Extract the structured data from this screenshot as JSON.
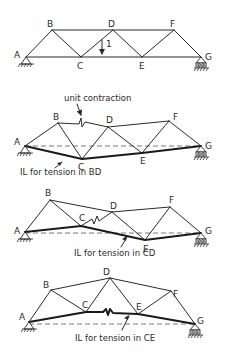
{
  "diagram": {
    "truss_original": {
      "labels": {
        "A": "A",
        "B": "B",
        "C": "C",
        "D": "D",
        "E": "E",
        "F": "F",
        "G": "G"
      },
      "load_label": "1"
    },
    "panel_bd": {
      "annotation": "unit contraction",
      "caption": "IL for tension in BD",
      "labels": {
        "A": "A",
        "B": "B",
        "C": "C",
        "D": "D",
        "E": "E",
        "F": "F",
        "G": "G"
      }
    },
    "panel_cd": {
      "caption": "IL for tension in CD",
      "labels": {
        "A": "A",
        "B": "B",
        "C": "C",
        "D": "D",
        "E": "E",
        "F": "F",
        "G": "G"
      }
    },
    "panel_ce": {
      "caption": "IL for tension in CE",
      "labels": {
        "A": "A",
        "B": "B",
        "C": "C",
        "D": "D",
        "E": "E",
        "F": "F",
        "G": "G"
      }
    }
  }
}
